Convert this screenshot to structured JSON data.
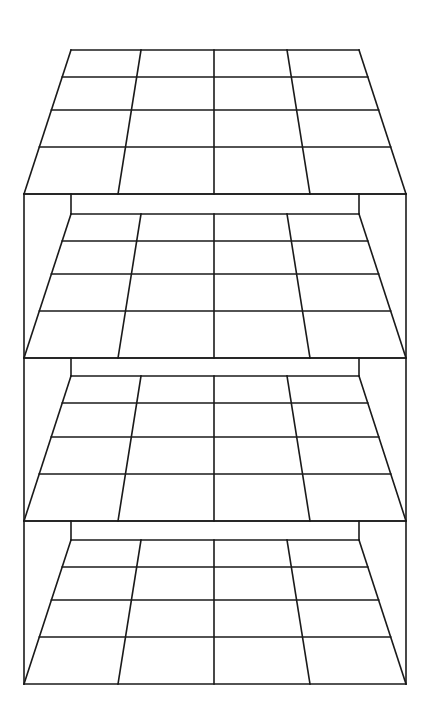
{
  "diagram": {
    "title": "",
    "stroke_color": "#1a1a1a",
    "background": "#ffffff",
    "grid_size": 4,
    "outer_box": {
      "left": 24,
      "right": 406,
      "top": 194,
      "bottom": 684
    },
    "back_rect": {
      "left": 71,
      "right": 359
    },
    "center_x": 214,
    "boards": [
      {
        "name": "board-1",
        "far_y": 50,
        "near_y": 194,
        "rows_y": [
          50,
          77,
          110,
          147,
          194
        ],
        "back_top_y": null
      },
      {
        "name": "board-2",
        "far_y": 214,
        "near_y": 358,
        "rows_y": [
          214,
          241,
          274,
          311,
          358
        ],
        "back_top_y": 194
      },
      {
        "name": "board-3",
        "far_y": 376,
        "near_y": 521,
        "rows_y": [
          376,
          403,
          437,
          474,
          521
        ],
        "back_top_y": 358
      },
      {
        "name": "board-4",
        "far_y": 540,
        "near_y": 684,
        "rows_y": [
          540,
          567,
          600,
          637,
          684
        ],
        "back_top_y": 521
      }
    ],
    "far_edge_x": [
      71,
      141,
      214,
      287,
      359
    ],
    "near_edge_x": [
      24,
      118,
      214,
      310,
      406
    ]
  }
}
